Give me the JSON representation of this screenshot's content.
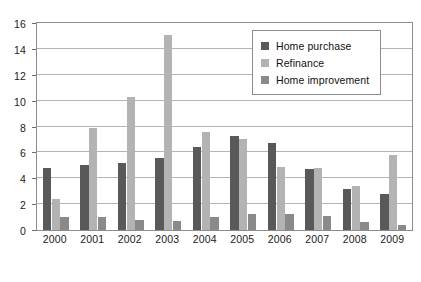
{
  "chart_data": {
    "type": "bar",
    "title": "",
    "subtitle": "",
    "xlabel": "",
    "ylabel": "",
    "categories": [
      "2000",
      "2001",
      "2002",
      "2003",
      "2004",
      "2005",
      "2006",
      "2007",
      "2008",
      "2009"
    ],
    "series": [
      {
        "name": "Home purchase",
        "color": "#595959",
        "values": [
          4.8,
          5.0,
          5.2,
          5.6,
          6.4,
          7.3,
          6.7,
          4.7,
          3.2,
          2.8
        ]
      },
      {
        "name": "Refinance",
        "color": "#b3b3b3",
        "values": [
          2.4,
          7.9,
          10.3,
          15.1,
          7.6,
          7.0,
          4.9,
          4.8,
          3.4,
          5.8
        ]
      },
      {
        "name": "Home improvement",
        "color": "#8a8a8a",
        "values": [
          1.0,
          1.0,
          0.8,
          0.7,
          1.0,
          1.2,
          1.2,
          1.1,
          0.6,
          0.4
        ]
      }
    ],
    "ylim": [
      0,
      16
    ],
    "yticks": [
      0,
      2,
      4,
      6,
      8,
      10,
      12,
      14,
      16
    ],
    "ytick_labels": [
      "0",
      "2",
      "4",
      "6",
      "8",
      "10",
      "12",
      "14",
      "16"
    ],
    "grid": true,
    "grid_axis": "y",
    "legend_position": "top-right",
    "plot_background": "#ffffff",
    "grid_color": "#b4b4b4",
    "frame_color": "#8c8c8c"
  }
}
